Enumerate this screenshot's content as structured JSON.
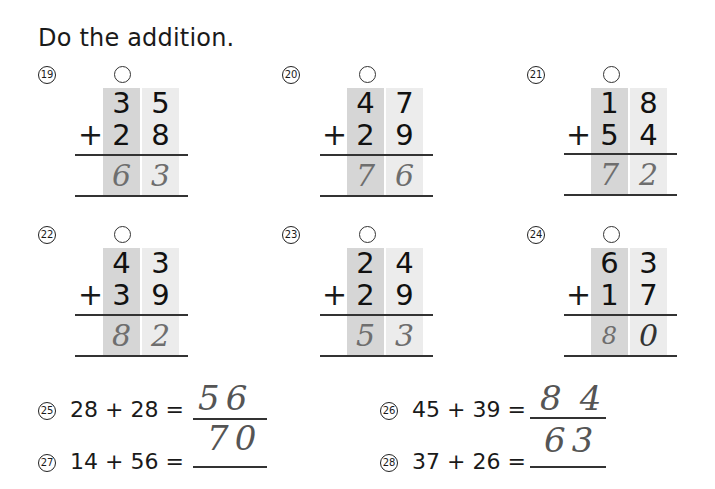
{
  "title": "Do the addition.",
  "vertical_problems": [
    {
      "num": "19",
      "top": [
        "3",
        "5"
      ],
      "bottom": [
        "2",
        "8"
      ],
      "operator": "+",
      "answer": [
        "6",
        "3"
      ],
      "carry_mark": "○"
    },
    {
      "num": "20",
      "top": [
        "4",
        "7"
      ],
      "bottom": [
        "2",
        "9"
      ],
      "operator": "+",
      "answer": [
        "7",
        "6"
      ],
      "carry_mark": "○"
    },
    {
      "num": "21",
      "top": [
        "1",
        "8"
      ],
      "bottom": [
        "5",
        "4"
      ],
      "operator": "+",
      "answer": [
        "7",
        "2"
      ],
      "carry_mark": "○"
    },
    {
      "num": "22",
      "top": [
        "4",
        "3"
      ],
      "bottom": [
        "3",
        "9"
      ],
      "operator": "+",
      "answer": [
        "8",
        "2"
      ],
      "carry_mark": "○"
    },
    {
      "num": "23",
      "top": [
        "2",
        "4"
      ],
      "bottom": [
        "2",
        "9"
      ],
      "operator": "+",
      "answer": [
        "5",
        "3"
      ],
      "carry_mark": "○"
    },
    {
      "num": "24",
      "top": [
        "6",
        "3"
      ],
      "bottom": [
        "1",
        "7"
      ],
      "operator": "+",
      "answer": [
        "8",
        "0"
      ],
      "carry_mark": "○"
    }
  ],
  "horizontal_problems": [
    {
      "num": "25",
      "expr": "28 + 28 =",
      "answer": "56"
    },
    {
      "num": "26",
      "expr": "45 + 39 =",
      "answer": "84"
    },
    {
      "num": "27",
      "expr": "14 + 56 =",
      "answer": "70"
    },
    {
      "num": "28",
      "expr": "37 + 26 =",
      "answer": "63"
    }
  ],
  "colors": {
    "tens_column": "#d6d6d6",
    "ones_column": "#ececec",
    "handwriting": "#6e6e6e"
  }
}
